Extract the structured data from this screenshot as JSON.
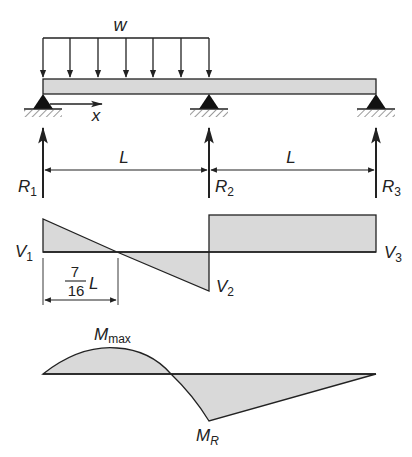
{
  "figure": {
    "type": "continuous beam with shear and moment diagrams",
    "colors": {
      "line": "#222222",
      "fill": "#d9d9d9",
      "background": "#ffffff"
    }
  },
  "beam": {
    "load_label": "w",
    "axis_label": "x",
    "span_label_1": "L",
    "span_label_2": "L",
    "reactions": [
      {
        "main": "R",
        "sub": "1"
      },
      {
        "main": "R",
        "sub": "2"
      },
      {
        "main": "R",
        "sub": "3"
      }
    ],
    "load_arrow_count": 7
  },
  "shear": {
    "v1": {
      "main": "V",
      "sub": "1"
    },
    "v2": {
      "main": "V",
      "sub": "2"
    },
    "v3": {
      "main": "V",
      "sub": "3"
    },
    "zero_dim": {
      "numerator": "7",
      "denominator": "16",
      "var": "L"
    }
  },
  "moment": {
    "mmax": {
      "main": "M",
      "sub": "max"
    },
    "mr": {
      "main": "M",
      "sub": "R"
    }
  }
}
